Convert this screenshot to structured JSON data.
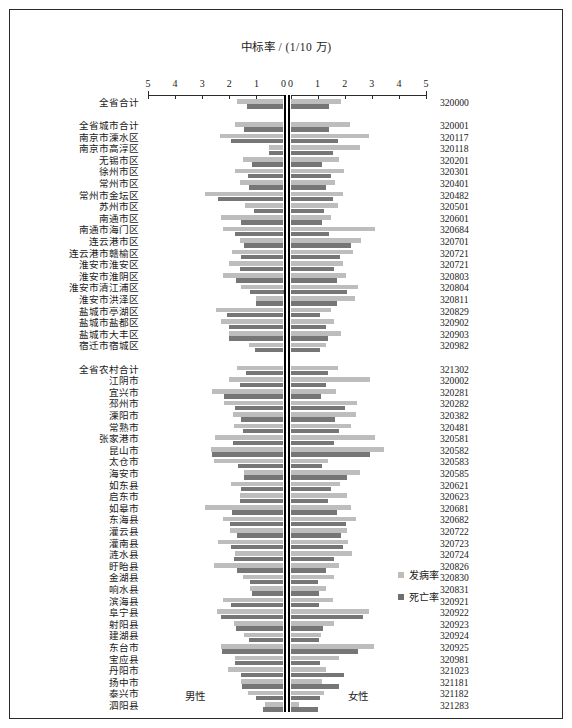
{
  "chart_data": {
    "type": "bar",
    "subtype": "paired-horizontal-pyramid",
    "title": "中标率 / (1/10 万)",
    "xlabel": "",
    "ylabel": "",
    "left_panel_label": "男性",
    "right_panel_label": "女性",
    "xlim": [
      0,
      5
    ],
    "left_axis_ticks": [
      5,
      4,
      3,
      2,
      1,
      0
    ],
    "right_axis_ticks": [
      0,
      1,
      2,
      3,
      4,
      5
    ],
    "grid": false,
    "legend_position": "right-middle",
    "legend": [
      {
        "name": "发病率",
        "color": "#bdbdbd"
      },
      {
        "name": "死亡率",
        "color": "#767676"
      }
    ],
    "series": [
      {
        "name": "发病率",
        "color": "#bdbdbd"
      },
      {
        "name": "死亡率",
        "color": "#767676"
      }
    ],
    "groups": [
      {
        "name": "全省合计",
        "rows": [
          {
            "label": "全省合计",
            "code": "320000",
            "male_incidence": 1.72,
            "male_mortality": 1.35,
            "female_incidence": 1.88,
            "female_mortality": 1.42
          }
        ]
      },
      {
        "name": "城市",
        "rows": [
          {
            "label": "全省城市合计",
            "code": "320001",
            "male_incidence": 1.8,
            "male_mortality": 1.45,
            "female_incidence": 2.2,
            "female_mortality": 1.42
          },
          {
            "label": "南京市溧水区",
            "code": "320117",
            "male_incidence": 2.35,
            "male_mortality": 1.92,
            "female_incidence": 2.9,
            "female_mortality": 1.75
          },
          {
            "label": "南京市高淳区",
            "code": "320118",
            "male_incidence": 0.52,
            "male_mortality": 0.52,
            "female_incidence": 2.58,
            "female_mortality": 1.55
          },
          {
            "label": "无锡市区",
            "code": "320201",
            "male_incidence": 1.48,
            "male_mortality": 1.18,
            "female_incidence": 1.78,
            "female_mortality": 1.18
          },
          {
            "label": "徐州市区",
            "code": "320301",
            "male_incidence": 1.78,
            "male_mortality": 1.3,
            "female_incidence": 1.98,
            "female_mortality": 1.5
          },
          {
            "label": "常州市区",
            "code": "320401",
            "male_incidence": 1.6,
            "male_mortality": 1.28,
            "female_incidence": 1.66,
            "female_mortality": 1.3
          },
          {
            "label": "常州市金坛区",
            "code": "320482",
            "male_incidence": 2.9,
            "male_mortality": 2.42,
            "female_incidence": 1.95,
            "female_mortality": 1.55
          },
          {
            "label": "苏州市区",
            "code": "320501",
            "male_incidence": 1.42,
            "male_mortality": 1.08,
            "female_incidence": 1.75,
            "female_mortality": 1.25
          },
          {
            "label": "南通市区",
            "code": "320601",
            "male_incidence": 2.3,
            "male_mortality": 1.55,
            "female_incidence": 1.5,
            "female_mortality": 1.18
          },
          {
            "label": "南通市海门区",
            "code": "320684",
            "male_incidence": 2.22,
            "male_mortality": 1.8,
            "female_incidence": 3.12,
            "female_mortality": 1.42
          },
          {
            "label": "连云港市区",
            "code": "320701",
            "male_incidence": 1.6,
            "male_mortality": 1.45,
            "female_incidence": 2.6,
            "female_mortality": 2.25
          },
          {
            "label": "连云港市赣榆区",
            "code": "320721",
            "male_incidence": 1.9,
            "male_mortality": 1.58,
            "female_incidence": 2.3,
            "female_mortality": 1.82
          },
          {
            "label": "淮安市淮安区",
            "code": "320721",
            "male_incidence": 2.02,
            "male_mortality": 1.6,
            "female_incidence": 1.95,
            "female_mortality": 1.62
          },
          {
            "label": "淮安市淮阴区",
            "code": "320803",
            "male_incidence": 2.25,
            "male_mortality": 1.75,
            "female_incidence": 2.05,
            "female_mortality": 1.7
          },
          {
            "label": "淮安市清江浦区",
            "code": "320804",
            "male_incidence": 1.58,
            "male_mortality": 1.25,
            "female_incidence": 2.48,
            "female_mortality": 2.1
          },
          {
            "label": "淮安市洪泽区",
            "code": "320811",
            "male_incidence": 1.02,
            "male_mortality": 1.02,
            "female_incidence": 2.38,
            "female_mortality": 1.72
          },
          {
            "label": "盐城市亭湖区",
            "code": "320829",
            "male_incidence": 2.48,
            "male_mortality": 2.1,
            "female_incidence": 1.48,
            "female_mortality": 1.1
          },
          {
            "label": "盐城市盐都区",
            "code": "320902",
            "male_incidence": 2.32,
            "male_mortality": 2.02,
            "female_incidence": 1.6,
            "female_mortality": 1.32
          },
          {
            "label": "盐城市大丰区",
            "code": "320903",
            "male_incidence": 2.0,
            "male_mortality": 2.0,
            "female_incidence": 1.85,
            "female_mortality": 1.38
          },
          {
            "label": "宿迁市宿城区",
            "code": "320982",
            "male_incidence": 1.28,
            "male_mortality": 1.05,
            "female_incidence": 1.32,
            "female_mortality": 1.1
          }
        ]
      },
      {
        "name": "农村",
        "rows": [
          {
            "label": "全省农村合计",
            "code": "321302",
            "male_incidence": 1.7,
            "male_mortality": 1.38,
            "female_incidence": 1.75,
            "female_mortality": 1.4
          },
          {
            "label": "江阴市",
            "code": "320002",
            "male_incidence": 2.0,
            "male_mortality": 1.6,
            "female_incidence": 2.95,
            "female_mortality": 1.3
          },
          {
            "label": "宜兴市",
            "code": "320281",
            "male_incidence": 2.62,
            "male_mortality": 2.18,
            "female_incidence": 1.68,
            "female_mortality": 1.12
          },
          {
            "label": "邳州市",
            "code": "320282",
            "male_incidence": 2.18,
            "male_mortality": 1.8,
            "female_incidence": 2.45,
            "female_mortality": 2.02
          },
          {
            "label": "溧阳市",
            "code": "320382",
            "male_incidence": 1.88,
            "male_mortality": 1.55,
            "female_incidence": 2.42,
            "female_mortality": 1.65
          },
          {
            "label": "常熟市",
            "code": "320481",
            "male_incidence": 1.82,
            "male_mortality": 1.5,
            "female_incidence": 2.25,
            "female_mortality": 1.78
          },
          {
            "label": "张家港市",
            "code": "320581",
            "male_incidence": 2.52,
            "male_mortality": 1.85,
            "female_incidence": 3.1,
            "female_mortality": 1.6
          },
          {
            "label": "昆山市",
            "code": "320582",
            "male_incidence": 2.68,
            "male_mortality": 2.62,
            "female_incidence": 3.45,
            "female_mortality": 2.92
          },
          {
            "label": "太仓市",
            "code": "320583",
            "male_incidence": 2.58,
            "male_mortality": 1.68,
            "female_incidence": 1.4,
            "female_mortality": 1.18
          },
          {
            "label": "海安市",
            "code": "320585",
            "male_incidence": 1.45,
            "male_mortality": 1.45,
            "female_incidence": 2.58,
            "female_mortality": 2.1
          },
          {
            "label": "如东县",
            "code": "320621",
            "male_incidence": 1.95,
            "male_mortality": 1.58,
            "female_incidence": 1.82,
            "female_mortality": 1.48
          },
          {
            "label": "启东市",
            "code": "320623",
            "male_incidence": 1.62,
            "male_mortality": 1.6,
            "female_incidence": 2.08,
            "female_mortality": 1.38
          },
          {
            "label": "如皋市",
            "code": "320681",
            "male_incidence": 2.9,
            "male_mortality": 1.9,
            "female_incidence": 2.25,
            "female_mortality": 1.72
          },
          {
            "label": "东海县",
            "code": "320682",
            "male_incidence": 2.22,
            "male_mortality": 1.98,
            "female_incidence": 2.4,
            "female_mortality": 2.05
          },
          {
            "label": "灌云县",
            "code": "320722",
            "male_incidence": 1.98,
            "male_mortality": 1.72,
            "female_incidence": 2.1,
            "female_mortality": 1.88
          },
          {
            "label": "灌南县",
            "code": "320723",
            "male_incidence": 2.42,
            "male_mortality": 1.95,
            "female_incidence": 2.12,
            "female_mortality": 1.95
          },
          {
            "label": "涟水县",
            "code": "320724",
            "male_incidence": 1.8,
            "male_mortality": 1.82,
            "female_incidence": 2.28,
            "female_mortality": 1.6
          },
          {
            "label": "盱眙县",
            "code": "320826",
            "male_incidence": 2.55,
            "male_mortality": 1.72,
            "female_incidence": 1.8,
            "female_mortality": 1.32
          },
          {
            "label": "金湖县",
            "code": "320830",
            "male_incidence": 1.48,
            "male_mortality": 1.22,
            "female_incidence": 1.6,
            "female_mortality": 1.02
          },
          {
            "label": "响水县",
            "code": "320831",
            "male_incidence": 1.22,
            "male_mortality": 1.15,
            "female_incidence": 1.32,
            "female_mortality": 1.05
          },
          {
            "label": "滨海县",
            "code": "320921",
            "male_incidence": 2.22,
            "male_mortality": 1.92,
            "female_incidence": 1.55,
            "female_mortality": 1.05
          },
          {
            "label": "阜宁县",
            "code": "320922",
            "male_incidence": 2.45,
            "male_mortality": 2.3,
            "female_incidence": 2.88,
            "female_mortality": 2.68
          },
          {
            "label": "射阳县",
            "code": "320923",
            "male_incidence": 1.82,
            "male_mortality": 1.75,
            "female_incidence": 1.62,
            "female_mortality": 1.2
          },
          {
            "label": "建湖县",
            "code": "320924",
            "male_incidence": 1.45,
            "male_mortality": 1.28,
            "female_incidence": 1.12,
            "female_mortality": 1.05
          },
          {
            "label": "东台市",
            "code": "320925",
            "male_incidence": 2.32,
            "male_mortality": 2.28,
            "female_incidence": 3.08,
            "female_mortality": 2.48
          },
          {
            "label": "宝应县",
            "code": "320981",
            "male_incidence": 1.78,
            "male_mortality": 1.8,
            "female_incidence": 1.78,
            "female_mortality": 1.1
          },
          {
            "label": "丹阳市",
            "code": "321023",
            "male_incidence": 2.05,
            "male_mortality": 1.55,
            "female_incidence": 1.3,
            "female_mortality": 1.98
          },
          {
            "label": "扬中市",
            "code": "321181",
            "male_incidence": 1.58,
            "male_mortality": 1.52,
            "female_incidence": 1.15,
            "female_mortality": 1.8
          },
          {
            "label": "泰兴市",
            "code": "321182",
            "male_incidence": 1.32,
            "male_mortality": 1.02,
            "female_incidence": 1.22,
            "female_mortality": 1.08
          },
          {
            "label": "泗阳县",
            "code": "321283",
            "male_incidence": 0.68,
            "male_mortality": 0.75,
            "female_incidence": 0.3,
            "female_mortality": 1.0
          }
        ]
      }
    ]
  }
}
